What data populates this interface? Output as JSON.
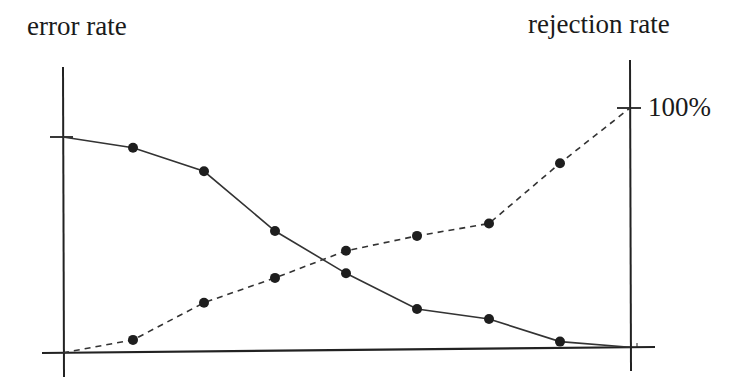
{
  "chart_data": {
    "type": "line",
    "title": "",
    "xlabel": "",
    "ylabel_left": "error rate",
    "ylabel_right": "rejection rate",
    "right_axis_ticks": [
      "100%"
    ],
    "grid": false,
    "legend": null,
    "x": [
      0,
      1,
      2,
      3,
      4,
      5,
      6,
      7,
      8
    ],
    "series": [
      {
        "name": "error rate",
        "axis": "left",
        "style": "solid",
        "markers_on": [
          1,
          2,
          3,
          4,
          5,
          6,
          7
        ],
        "values": [
          1.0,
          0.95,
          0.84,
          0.56,
          0.36,
          0.19,
          0.14,
          0.03,
          0.0
        ]
      },
      {
        "name": "rejection rate",
        "axis": "right",
        "style": "dashed",
        "markers_on": [
          1,
          2,
          3,
          4,
          5,
          6,
          7
        ],
        "unit": "%",
        "values": [
          0,
          5,
          20,
          30,
          41,
          47,
          52,
          77,
          100
        ]
      }
    ],
    "ylim_left": [
      0,
      1
    ],
    "ylim_right": [
      0,
      100
    ]
  },
  "labels": {
    "left_axis_title": "error rate",
    "right_axis_title": "rejection rate",
    "right_tick_100": "100%"
  },
  "colors": {
    "line": "#333333",
    "marker": "#1e1e1e",
    "axis": "#222222"
  }
}
